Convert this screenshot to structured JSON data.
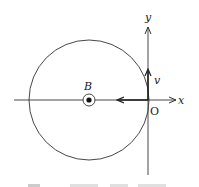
{
  "diagram": {
    "axes": {
      "x_label": "x",
      "y_label": "y",
      "origin_label": "O"
    },
    "field": {
      "label": "B",
      "symbol": "out-of-page (dot in circle)"
    },
    "velocity": {
      "label": "v",
      "direction": "+y"
    },
    "circle": {
      "center": [
        89,
        100
      ],
      "radius": 60
    },
    "colors": {
      "stroke": "#333333",
      "background": "#ffffff"
    },
    "caption": ""
  }
}
